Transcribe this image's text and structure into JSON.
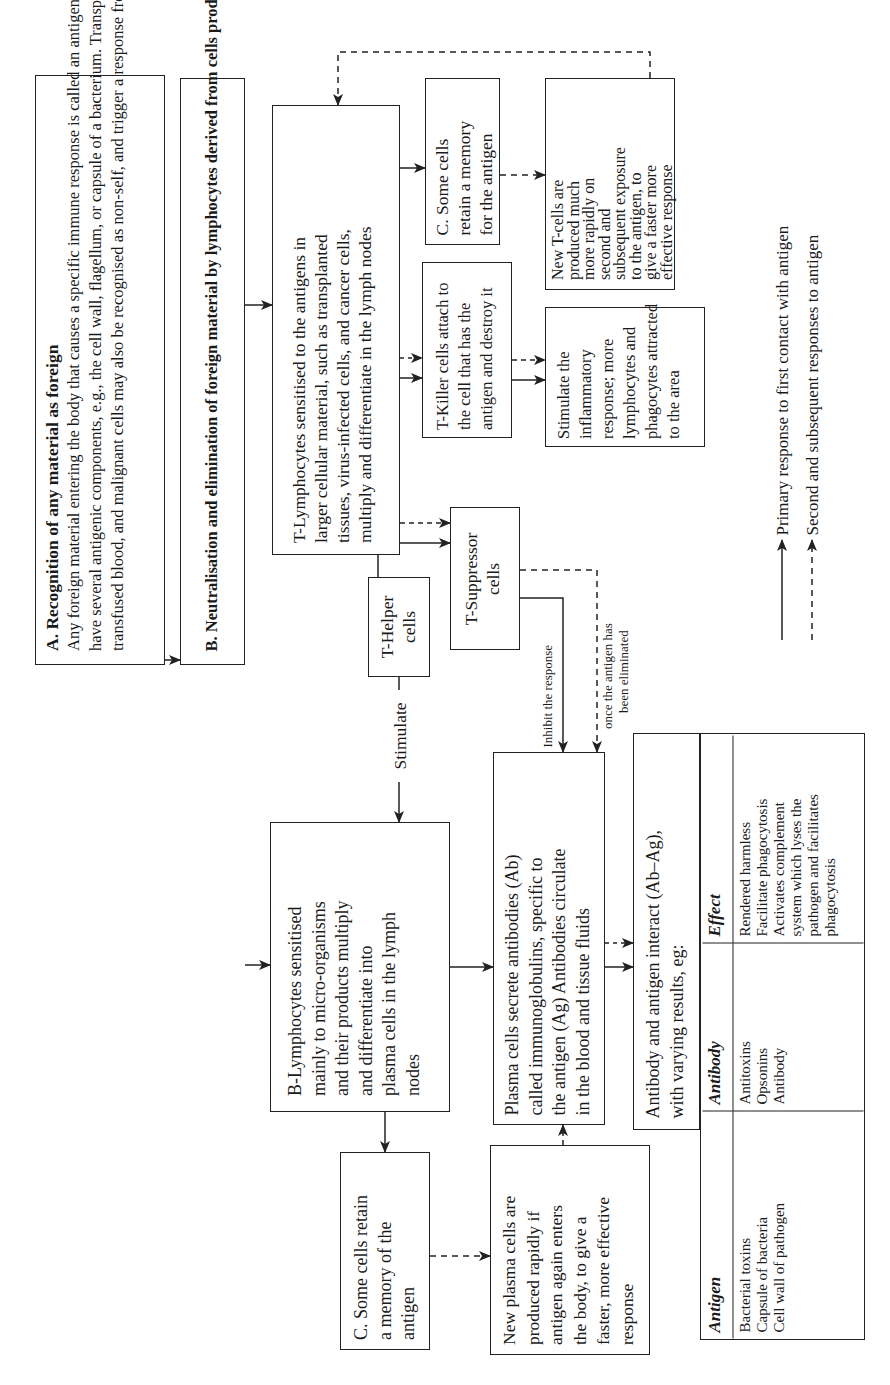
{
  "diagram": {
    "orientation": "rotated 90 degrees counter-clockwise",
    "box_a": {
      "title": "A. Recognition of any material as foreign",
      "lines": [
        "Any foreign material entering the body that causes a specific immune response is called an antigen. Most foreign materials",
        "have several antigenic components, e.g., the cell wall, flagellum, or capsule of a bacterium. Transplanted organs,",
        "transfused blood, and malignant cells may also be recognised as non-self, and trigger a response from certain lymphocytes"
      ]
    },
    "box_b": {
      "title": "B. Neutralisation and elimination of foreign material by lymphocytes derived from cells produced in the bone marrow"
    },
    "t_lymphocytes": {
      "lines": [
        "T-Lymphocytes sensitised to the antigens in",
        "larger cellular material, such as transplanted",
        "tissues, virus-infected cells, and cancer cells,",
        "multiply and differentiate in the lymph nodes"
      ]
    },
    "t_memory": {
      "lines": [
        "C. Some cells",
        "retain a memory",
        "for the antigen"
      ]
    },
    "new_t_cells": {
      "lines": [
        "New T-cells are",
        "produced much",
        "more rapidly on",
        "second and",
        "subsequent exposure",
        "to the antigen, to",
        "give a faster more",
        "effective response"
      ]
    },
    "t_killer": {
      "lines": [
        "T-Killer cells attach to",
        "the cell that has the",
        "antigen and destroy it"
      ]
    },
    "inflammatory": {
      "lines": [
        "Stimulate the",
        "inflammatory",
        "response; more",
        "lymphocytes and",
        "phagocytes attracted",
        "to the area"
      ]
    },
    "t_suppressor": {
      "lines": [
        "T-Suppressor",
        "cells"
      ]
    },
    "t_helper": {
      "lines": [
        "T-Helper",
        "cells"
      ]
    },
    "stimulate_label": "Stimulate",
    "inhibit_label": "Inhibit the response",
    "once_label": [
      "once the antigen has",
      "been eliminated"
    ],
    "b_lymphocytes": {
      "lines": [
        "B-Lymphocytes sensitised",
        "mainly to micro-organisms",
        "and their products multiply",
        "and differentiate into",
        "plasma cells in the lymph",
        "nodes"
      ]
    },
    "plasma_cells": {
      "lines": [
        "Plasma cells secrete antibodies (Ab)",
        "called immunoglobulins, specific to",
        "the antigen (Ag) Antibodies circulate",
        "in the blood and tissue fluids"
      ]
    },
    "b_memory": {
      "lines": [
        "C. Some cells retain",
        "a memory of the",
        "antigen"
      ]
    },
    "new_plasma": {
      "lines": [
        "New plasma cells are",
        "produced rapidly if",
        "antigen again enters",
        "the body, to give a",
        "faster, more effective",
        "response"
      ]
    },
    "ab_ag": {
      "lines": [
        "Antibody and antigen interact (Ab–Ag),",
        "with varying results, eg:"
      ]
    },
    "table": {
      "headers": [
        "Antigen",
        "Antibody",
        "Effect"
      ],
      "rows": [
        {
          "antigen": [
            "Bacterial toxins",
            "Capsule of bacteria",
            "Cell wall of pathogen"
          ],
          "antibody": [
            "Antitoxins",
            "Opsonins",
            "Antibody"
          ],
          "effect": [
            "Rendered harmless",
            "Facilitate phagocytosis",
            "Activates complement",
            "system which lyses the",
            "pathogen and facilitates",
            "phagocytosis"
          ]
        }
      ]
    },
    "legend": {
      "items": [
        {
          "style": "solid",
          "label": "Primary response to first contact with antigen"
        },
        {
          "style": "dashed",
          "label": "Second and subsequent responses to antigen"
        }
      ]
    },
    "colors": {
      "line": "#222222",
      "text": "#1a1a1a",
      "background": "#ffffff"
    }
  }
}
